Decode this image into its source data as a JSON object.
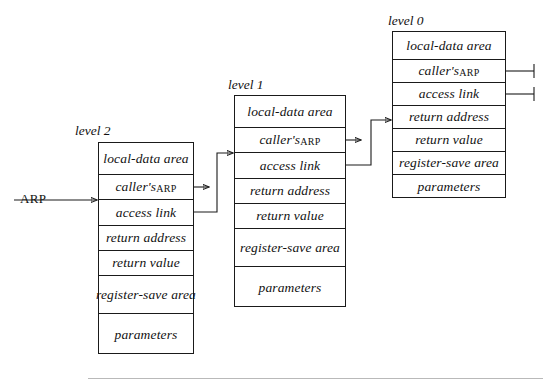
{
  "diagram": {
    "rows": [
      "local-data area",
      "caller's ARP",
      "access link",
      "return address",
      "return value",
      "register-save area",
      "parameters"
    ],
    "row_split": {
      "callers_arp_prefix": "caller's ",
      "callers_arp_caps": "ARP"
    },
    "frames": [
      {
        "id": "level-2",
        "label": "level 2",
        "cells": [
          "local-data area",
          "caller's ARP",
          "access link",
          "return address",
          "return value",
          "register-save area",
          "parameters"
        ]
      },
      {
        "id": "level-1",
        "label": "level 1",
        "cells": [
          "local-data area",
          "caller's ARP",
          "access link",
          "return address",
          "return value",
          "register-save area",
          "parameters"
        ]
      },
      {
        "id": "level-0",
        "label": "level 0",
        "cells": [
          "local-data area",
          "caller's ARP",
          "access link",
          "return address",
          "return value",
          "register-save area",
          "parameters"
        ]
      }
    ],
    "entry_pointer": {
      "label": "ARP",
      "target": "level-2 access link boundary"
    },
    "null_markers": {
      "count": 2,
      "meaning": "null pointer (ground) terminators on level 0 caller's ARP and access link"
    },
    "stroke_color": "#1a1a1a",
    "background_color": "#ffffff",
    "rule_color": "#b9b9b9"
  }
}
